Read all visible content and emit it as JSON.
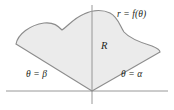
{
  "figure": {
    "kind": "polar-area-diagram",
    "labels": {
      "curve": "r = f(θ)",
      "region": "R",
      "ray_left": "θ = β",
      "ray_right": "θ = α"
    },
    "colors": {
      "region_fill": "#ebebeb",
      "region_stroke": "#8c8c8c",
      "axis": "#8c8c8c",
      "label_text": "#231f20",
      "background": "#ffffff"
    },
    "geometry": {
      "origin": [
        92,
        91
      ],
      "axis_horizontal": {
        "x1": 6,
        "y1": 91,
        "x2": 168,
        "y2": 91
      },
      "axis_vertical": {
        "x1": 92,
        "y1": 5,
        "x2": 92,
        "y2": 104
      },
      "ray_left_end": [
        16,
        44
      ],
      "ray_right_end": [
        160,
        52
      ],
      "curve_leftmost": [
        16,
        44
      ],
      "curve_local_min": [
        62,
        30
      ],
      "curve_peak": [
        108,
        12
      ],
      "curve_rightmost": [
        160,
        52
      ],
      "curve_path": "M 16 44 C 18 34 30 25 44 23 C 54 22 58 26 62 30 C 68 26 74 18 84 14 C 94 9 104 10 110 13 C 118 17 120 26 124 32 C 130 39 142 43 152 46 C 157 48 160 50 160 52"
    }
  }
}
